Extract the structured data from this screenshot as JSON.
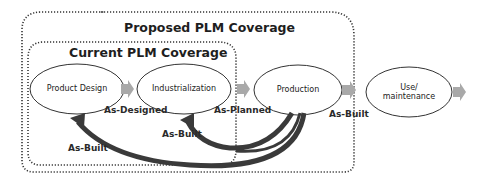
{
  "diagram": {
    "regions": {
      "proposed": {
        "title": "Proposed PLM Coverage"
      },
      "current": {
        "title": "Current PLM Coverage"
      }
    },
    "nodes": [
      {
        "id": "product-design",
        "label": "Product Design"
      },
      {
        "id": "industrialization",
        "label": "Industrialization"
      },
      {
        "id": "production",
        "label": "Production"
      },
      {
        "id": "use-maintenance",
        "label_line1": "Use/",
        "label_line2": "maintenance"
      }
    ],
    "flow_labels": {
      "as_designed": "As-Designed",
      "as_planned": "As-Planned",
      "as_built_forward": "As-Built",
      "as_built_inner": "As-Built",
      "as_built_outer": "As-Built"
    },
    "colors": {
      "arrow_fill": "#a9a9a9",
      "feedback_arrow": "#3a3a3a",
      "outline": "#333333"
    }
  }
}
